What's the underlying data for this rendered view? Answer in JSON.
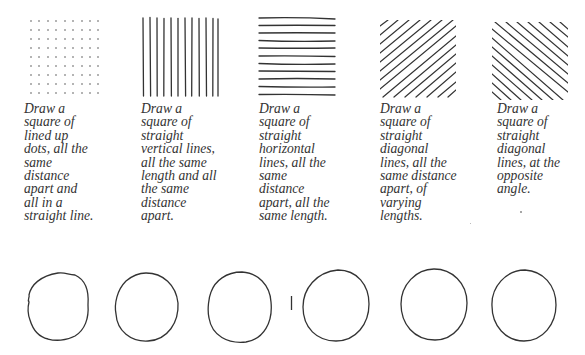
{
  "exercises": [
    {
      "pattern": "dots-grid",
      "caption_lines": [
        "Draw a",
        "square of",
        "lined up",
        "dots, all the",
        "same",
        "distance",
        "apart and",
        "all in a",
        "straight line."
      ]
    },
    {
      "pattern": "vertical-lines",
      "caption_lines": [
        "Draw a",
        "square of",
        "straight",
        "vertical lines,",
        "all the same",
        "length and all",
        "the same",
        "distance",
        "apart."
      ]
    },
    {
      "pattern": "horizontal-lines",
      "caption_lines": [
        "Draw a",
        "square of",
        "straight",
        "horizontal",
        "lines, all the",
        "same",
        "distance",
        "apart, all the",
        "same length."
      ]
    },
    {
      "pattern": "diagonal-lines",
      "caption_lines": [
        "Draw a",
        "square of",
        "straight",
        "diagonal",
        "lines, all the",
        "same distance",
        "apart, of",
        "varying",
        "lengths."
      ]
    },
    {
      "pattern": "opposite-diagonal-lines",
      "caption_lines": [
        "Draw a",
        "square of",
        "straight",
        "diagonal",
        "lines, at the",
        "opposite",
        "angle."
      ]
    }
  ],
  "circles": {
    "count": 6
  },
  "colors": {
    "ink": "#333333",
    "background": "#ffffff"
  }
}
